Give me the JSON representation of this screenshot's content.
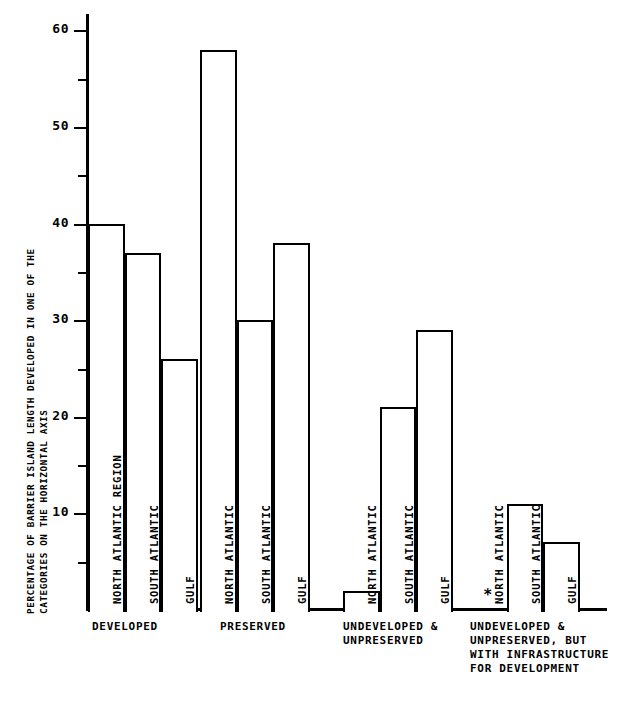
{
  "chart_data": {
    "type": "bar",
    "title": "",
    "subtitle": "",
    "xlabel": "",
    "ylabel_line1": "PERCENTAGE OF BARRIER ISLAND LENGTH DEVELOPED IN ONE OF THE",
    "ylabel_line2": "CATEGORIES ON THE HORIZONTAL AXIS",
    "ylim": [
      0,
      63
    ],
    "yticks_major": [
      10,
      20,
      30,
      40,
      50,
      60
    ],
    "yticks_minor": [
      5,
      15,
      25,
      35,
      45,
      55
    ],
    "ytick_labels": [
      "10",
      "20",
      "30",
      "40",
      "50",
      "60"
    ],
    "grid": false,
    "legend": "none",
    "categories": [
      "DEVELOPED",
      "PRESERVED",
      "UNDEVELOPED &\nUNPRESERVED",
      "UNDEVELOPED &\nUNPRESERVED, BUT\nWITH INFRASTRUCTURE\nFOR DEVELOPMENT"
    ],
    "groups": [
      {
        "caption": "DEVELOPED",
        "bars": [
          {
            "label": "NORTH ATLANTIC REGION",
            "value": 40,
            "no_data": false
          },
          {
            "label": "SOUTH ATLANTIC",
            "value": 37,
            "no_data": false
          },
          {
            "label": "GULF",
            "value": 26,
            "no_data": false
          }
        ]
      },
      {
        "caption": "PRESERVED",
        "bars": [
          {
            "label": "NORTH ATLANTIC",
            "value": 58,
            "no_data": false
          },
          {
            "label": "SOUTH ATLANTIC",
            "value": 30,
            "no_data": false
          },
          {
            "label": "GULF",
            "value": 38,
            "no_data": false
          }
        ]
      },
      {
        "caption": "UNDEVELOPED &\nUNPRESERVED",
        "bars": [
          {
            "label": "NORTH ATLANTIC",
            "value": 2,
            "no_data": false
          },
          {
            "label": "SOUTH ATLANTIC",
            "value": 21,
            "no_data": false
          },
          {
            "label": "GULF",
            "value": 29,
            "no_data": false
          }
        ]
      },
      {
        "caption": "UNDEVELOPED &\nUNPRESERVED, BUT\nWITH INFRASTRUCTURE\nFOR DEVELOPMENT",
        "bars": [
          {
            "label": "NORTH ATLANTIC",
            "value": 0,
            "no_data": true,
            "no_data_mark": "*"
          },
          {
            "label": "SOUTH ATLANTIC",
            "value": 11,
            "no_data": false
          },
          {
            "label": "GULF",
            "value": 7,
            "no_data": false
          }
        ]
      }
    ],
    "footnote": "",
    "colors": {
      "ink": "#000000",
      "background": "#ffffff",
      "bar_fill": "#ffffff",
      "bar_stroke": "#000000"
    }
  },
  "geometry": {
    "baseline_y": 610,
    "px_per_unit": 9.66,
    "bar_width": 36.5,
    "group_starts": [
      88,
      200,
      343,
      470
    ],
    "group_caption_tops": [
      620,
      620,
      620,
      620
    ],
    "group_caption_lefts": [
      92,
      220,
      343,
      470
    ]
  }
}
